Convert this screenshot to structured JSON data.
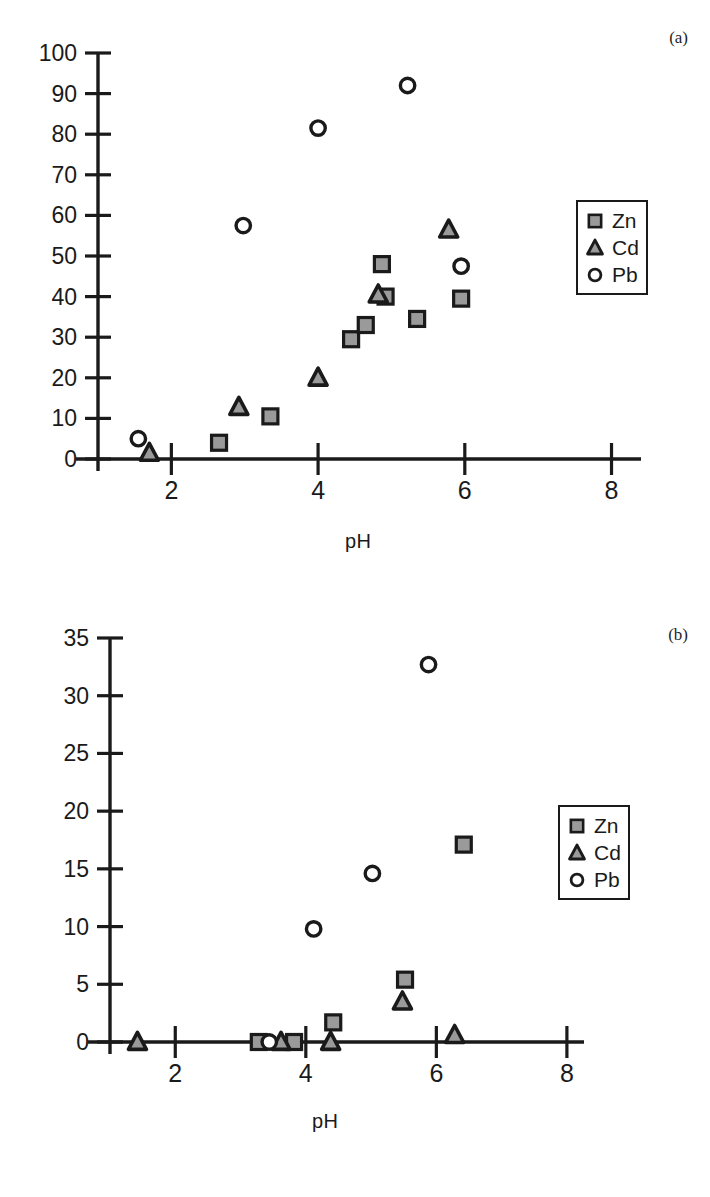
{
  "figures": [
    {
      "panel": "(a)",
      "xlabel": "pH",
      "legend_title": "",
      "legend": [
        {
          "label": "Zn",
          "marker": "square"
        },
        {
          "label": "Cd",
          "marker": "triangle"
        },
        {
          "label": "Pb",
          "marker": "circle"
        }
      ]
    },
    {
      "panel": "(b)",
      "xlabel": "pH",
      "legend_title": "",
      "legend": [
        {
          "label": "Zn",
          "marker": "square"
        },
        {
          "label": "Cd",
          "marker": "triangle"
        },
        {
          "label": "Pb",
          "marker": "circle"
        }
      ]
    }
  ],
  "chart_data": [
    {
      "type": "scatter",
      "title": "(a)",
      "xlabel": "pH",
      "ylabel": "",
      "xlim": [
        1.0,
        8.5
      ],
      "ylim": [
        0,
        100
      ],
      "xticks": [
        2,
        4,
        6,
        8
      ],
      "xticklabels": [
        "2",
        "4",
        "6",
        "8"
      ],
      "yticks": [
        0,
        10,
        20,
        30,
        40,
        50,
        60,
        70,
        80,
        90,
        100
      ],
      "yticklabels": [
        "0",
        "10",
        "20",
        "30",
        "40",
        "50",
        "60",
        "70",
        "80",
        "90",
        "100"
      ],
      "grid": false,
      "legend_position": "right",
      "series": [
        {
          "name": "Zn",
          "marker": "square",
          "points": [
            {
              "x": 2.65,
              "y": 4.0
            },
            {
              "x": 3.35,
              "y": 10.5
            },
            {
              "x": 4.45,
              "y": 29.5
            },
            {
              "x": 4.65,
              "y": 33.0
            },
            {
              "x": 4.87,
              "y": 48.0
            },
            {
              "x": 4.92,
              "y": 40.0
            },
            {
              "x": 5.35,
              "y": 34.5
            },
            {
              "x": 5.95,
              "y": 39.5
            }
          ]
        },
        {
          "name": "Cd",
          "marker": "triangle",
          "points": [
            {
              "x": 1.7,
              "y": 1.5
            },
            {
              "x": 2.92,
              "y": 12.8
            },
            {
              "x": 4.0,
              "y": 20.0
            },
            {
              "x": 4.82,
              "y": 40.5
            },
            {
              "x": 5.78,
              "y": 56.5
            }
          ]
        },
        {
          "name": "Pb",
          "marker": "circle",
          "points": [
            {
              "x": 1.55,
              "y": 5.0
            },
            {
              "x": 2.98,
              "y": 57.5
            },
            {
              "x": 4.0,
              "y": 81.5
            },
            {
              "x": 5.22,
              "y": 92.0
            },
            {
              "x": 5.95,
              "y": 47.5
            }
          ]
        }
      ]
    },
    {
      "type": "scatter",
      "title": "(b)",
      "xlabel": "pH",
      "ylabel": "",
      "xlim": [
        1.0,
        8.5
      ],
      "ylim": [
        0,
        35
      ],
      "xticks": [
        2,
        4,
        6,
        8
      ],
      "xticklabels": [
        "2",
        "4",
        "6",
        "8"
      ],
      "yticks": [
        0,
        5,
        10,
        15,
        20,
        25,
        30,
        35
      ],
      "yticklabels": [
        "0",
        "5",
        "10",
        "15",
        "20",
        "25",
        "30",
        "35"
      ],
      "grid": false,
      "legend_position": "right",
      "series": [
        {
          "name": "Zn",
          "marker": "square",
          "points": [
            {
              "x": 3.28,
              "y": 0.0
            },
            {
              "x": 3.82,
              "y": 0.0
            },
            {
              "x": 4.42,
              "y": 1.7
            },
            {
              "x": 5.52,
              "y": 5.4
            },
            {
              "x": 6.42,
              "y": 17.1
            }
          ]
        },
        {
          "name": "Cd",
          "marker": "triangle",
          "points": [
            {
              "x": 1.42,
              "y": 0.0
            },
            {
              "x": 3.62,
              "y": 0.0
            },
            {
              "x": 4.38,
              "y": 0.0
            },
            {
              "x": 5.48,
              "y": 3.5
            },
            {
              "x": 6.28,
              "y": 0.6
            }
          ]
        },
        {
          "name": "Pb",
          "marker": "circle",
          "points": [
            {
              "x": 3.44,
              "y": 0.0
            },
            {
              "x": 4.12,
              "y": 9.8
            },
            {
              "x": 5.02,
              "y": 14.6
            },
            {
              "x": 5.88,
              "y": 32.7
            }
          ]
        }
      ]
    }
  ]
}
